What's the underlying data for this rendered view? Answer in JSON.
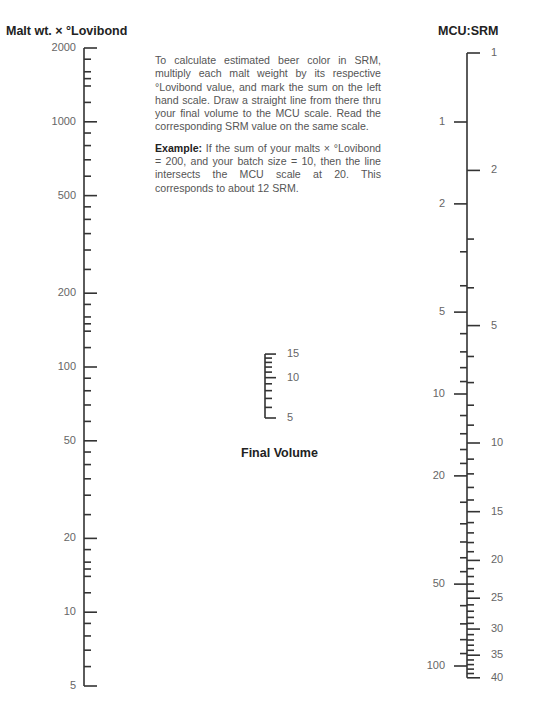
{
  "titles": {
    "left_scale": "Malt wt. × °Lovibond",
    "right_scale": "MCU:SRM",
    "center_scale": "Final Volume"
  },
  "instructions": {
    "paragraph1": "To calculate estimated beer color in SRM, multiply each malt weight by its respective °Lovibond value, and mark the sum on the left hand scale. Draw a straight line from there thru your final volume to the MCU scale. Read the corresponding SRM value on the same scale.",
    "example_label": "Example:",
    "example_text": " If the sum of your malts × °Lovibond = 200, and your batch size = 10, then the line intersects the MCU scale at 20. This corresponds to about 12 SRM."
  },
  "chart_data": {
    "type": "nomogram",
    "scales": [
      {
        "name": "Malt wt. × °Lovibond",
        "scale": "log",
        "range": [
          5,
          2000
        ],
        "major": [
          5,
          10,
          20,
          50,
          100,
          200,
          500,
          1000,
          2000
        ],
        "minor": [
          6,
          7,
          8,
          9,
          12,
          14,
          15,
          16,
          18,
          25,
          30,
          35,
          40,
          45,
          60,
          70,
          80,
          90,
          120,
          140,
          150,
          160,
          180,
          250,
          300,
          350,
          400,
          450,
          600,
          700,
          800,
          900,
          1200,
          1400,
          1500,
          1600,
          1800
        ]
      },
      {
        "name": "Final Volume",
        "scale": "log",
        "range": [
          5,
          15
        ],
        "major": [
          5,
          10,
          15
        ],
        "minor": [
          6,
          7,
          8,
          9,
          11,
          12,
          13,
          14
        ]
      },
      {
        "name": "MCU",
        "side": "left",
        "scale": "log",
        "range": [
          1,
          100
        ],
        "major": [
          1,
          2,
          5,
          10,
          20,
          50,
          100
        ],
        "minor": [
          3,
          4,
          6,
          7,
          8,
          9,
          12,
          14,
          16,
          18,
          25,
          30,
          35,
          40,
          45,
          60,
          70,
          80,
          90
        ]
      },
      {
        "name": "SRM",
        "side": "right",
        "scale": "log",
        "range": [
          1,
          40
        ],
        "major": [
          1,
          2,
          5,
          10,
          15,
          20,
          25,
          30,
          35,
          40
        ],
        "minor": [
          3,
          4,
          6,
          7,
          8,
          9,
          11,
          12,
          13,
          14,
          16,
          17,
          18,
          19,
          21,
          22,
          23,
          24,
          26,
          27,
          28,
          29,
          31,
          32,
          33,
          34,
          36,
          37,
          38,
          39
        ]
      }
    ],
    "example": {
      "malt_lovibond_sum": 200,
      "batch_size": 10,
      "mcu": 20,
      "srm": 12
    }
  }
}
